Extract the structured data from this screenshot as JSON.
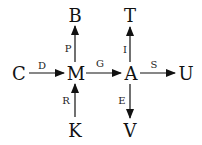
{
  "diagram": {
    "type": "directed-graph",
    "nodes": [
      {
        "id": "C",
        "label": "C"
      },
      {
        "id": "M",
        "label": "M"
      },
      {
        "id": "A",
        "label": "A"
      },
      {
        "id": "U",
        "label": "U"
      },
      {
        "id": "B",
        "label": "B"
      },
      {
        "id": "K",
        "label": "K"
      },
      {
        "id": "T",
        "label": "T"
      },
      {
        "id": "V",
        "label": "V"
      }
    ],
    "edges": [
      {
        "from": "C",
        "to": "M",
        "label": "D"
      },
      {
        "from": "M",
        "to": "A",
        "label": "G"
      },
      {
        "from": "A",
        "to": "U",
        "label": "S"
      },
      {
        "from": "M",
        "to": "B",
        "label": "P"
      },
      {
        "from": "K",
        "to": "M",
        "label": "R"
      },
      {
        "from": "A",
        "to": "T",
        "label": "I"
      },
      {
        "from": "A",
        "to": "V",
        "label": "E"
      }
    ]
  }
}
